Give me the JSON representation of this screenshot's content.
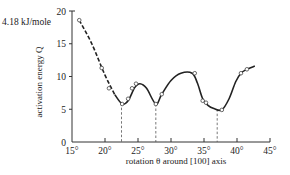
{
  "chart_data": {
    "type": "line",
    "title": "",
    "unit_label": "4.18 kJ/mole",
    "xlabel": "rotation θ around [100] axis",
    "ylabel": "activation energy Q",
    "xlim": [
      15,
      45
    ],
    "ylim": [
      0,
      20
    ],
    "x_ticks": [
      "15°",
      "20°",
      "25°",
      "30°",
      "35°",
      "40°",
      "45°"
    ],
    "x_tick_values": [
      15,
      20,
      25,
      30,
      35,
      40,
      45
    ],
    "y_ticks": [
      "0",
      "5",
      "10",
      "15",
      "20"
    ],
    "y_tick_values": [
      0,
      5,
      10,
      15,
      20
    ],
    "grid": false,
    "legend": null,
    "series": [
      {
        "name": "measured activation energy",
        "marker": "open-circle",
        "points": [
          {
            "x": 16.1,
            "y": 18.6
          },
          {
            "x": 19.5,
            "y": 11.3
          },
          {
            "x": 20.6,
            "y": 8.2
          },
          {
            "x": 22.6,
            "y": 5.8
          },
          {
            "x": 23.5,
            "y": 6.6
          },
          {
            "x": 24.1,
            "y": 8.2
          },
          {
            "x": 24.7,
            "y": 8.9
          },
          {
            "x": 27.7,
            "y": 5.8
          },
          {
            "x": 28.6,
            "y": 7.3
          },
          {
            "x": 33.6,
            "y": 10.5
          },
          {
            "x": 34.8,
            "y": 6.3
          },
          {
            "x": 35.3,
            "y": 6.0
          },
          {
            "x": 37.7,
            "y": 4.9
          },
          {
            "x": 40.6,
            "y": 10.5
          },
          {
            "x": 41.5,
            "y": 11.1
          }
        ],
        "curve": [
          [
            16.1,
            18.6
          ],
          [
            18,
            15.0
          ],
          [
            20,
            10.2
          ],
          [
            21.5,
            7.2
          ],
          [
            22.6,
            5.8
          ],
          [
            23.5,
            6.3
          ],
          [
            24.5,
            8.3
          ],
          [
            25.3,
            8.9
          ],
          [
            26.3,
            8.2
          ],
          [
            27.7,
            5.8
          ],
          [
            28.6,
            7.3
          ],
          [
            30,
            9.4
          ],
          [
            31.5,
            10.5
          ],
          [
            33.2,
            10.5
          ],
          [
            34.0,
            9.0
          ],
          [
            34.8,
            6.6
          ],
          [
            35.6,
            5.6
          ],
          [
            36.5,
            5.1
          ],
          [
            37.7,
            4.9
          ],
          [
            38.8,
            6.6
          ],
          [
            39.8,
            9.2
          ],
          [
            40.6,
            10.5
          ],
          [
            41.5,
            11.1
          ],
          [
            42.7,
            11.6
          ]
        ],
        "dashed_until_x": 20.6
      }
    ],
    "annotations": {
      "minima_dashed_lines_x": [
        22.5,
        27.7,
        37.0
      ]
    }
  }
}
